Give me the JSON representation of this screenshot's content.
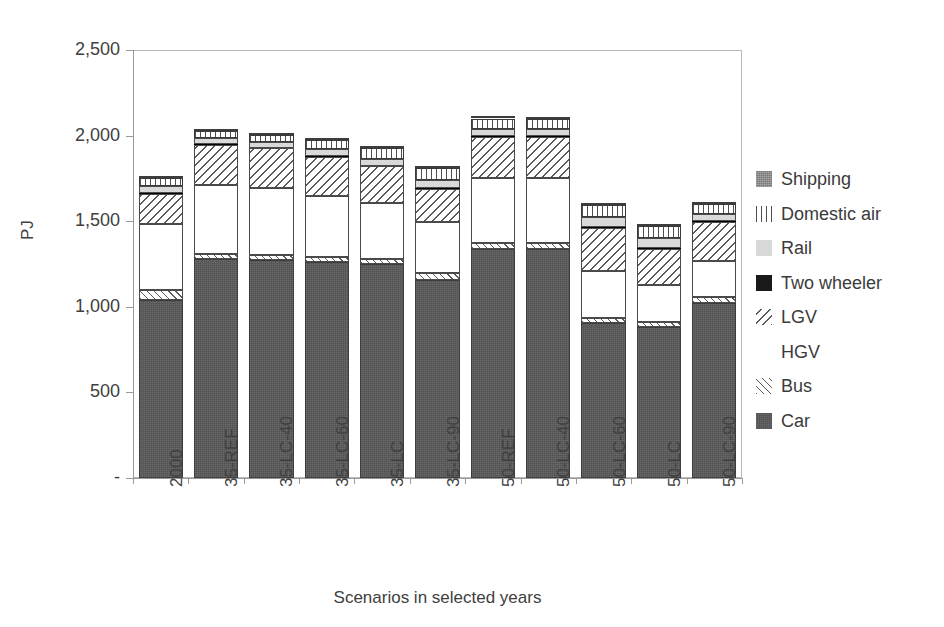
{
  "chart_data": {
    "type": "bar",
    "subtype": "stacked-vertical",
    "title": "",
    "xlabel": "Scenarios in selected years",
    "ylabel": "PJ",
    "ylim": [
      0,
      2500
    ],
    "ytick_values": [
      0,
      500,
      1000,
      1500,
      2000,
      2500
    ],
    "ytick_labels": [
      "-",
      "500",
      "1,000",
      "1,500",
      "2,000",
      "2,500"
    ],
    "grid": false,
    "legend_position": "right",
    "categories": [
      "2000",
      "35-REF",
      "35-LC-40",
      "35-LC-60",
      "35-LC",
      "35-LC-90",
      "50-REF",
      "50-LC-40",
      "50-LC-60",
      "50-LC",
      "50-LC-90"
    ],
    "series": [
      {
        "name": "Car",
        "pattern": "solid-dark-gray",
        "values": [
          1040,
          1280,
          1275,
          1260,
          1250,
          1155,
          1340,
          1340,
          905,
          880,
          1020
        ]
      },
      {
        "name": "Bus",
        "pattern": "diagonal-hatch-fwd",
        "values": [
          60,
          30,
          30,
          30,
          30,
          40,
          35,
          35,
          30,
          30,
          35
        ]
      },
      {
        "name": "HGV",
        "pattern": "white",
        "values": [
          385,
          400,
          390,
          360,
          325,
          300,
          375,
          375,
          275,
          215,
          210
        ]
      },
      {
        "name": "LGV",
        "pattern": "diagonal-hatch-back",
        "values": [
          175,
          235,
          230,
          225,
          215,
          195,
          240,
          240,
          250,
          215,
          230
        ]
      },
      {
        "name": "Two wheeler",
        "pattern": "solid-black",
        "values": [
          5,
          5,
          5,
          5,
          5,
          5,
          5,
          5,
          5,
          5,
          5
        ]
      },
      {
        "name": "Rail",
        "pattern": "light-gray",
        "values": [
          40,
          35,
          35,
          40,
          40,
          45,
          45,
          45,
          60,
          55,
          45
        ]
      },
      {
        "name": "Domestic air",
        "pattern": "vertical-stripes",
        "values": [
          45,
          40,
          40,
          55,
          60,
          70,
          60,
          55,
          70,
          70,
          55
        ]
      },
      {
        "name": "Shipping",
        "pattern": "texture-gray",
        "values": [
          10,
          10,
          10,
          10,
          10,
          10,
          10,
          10,
          10,
          10,
          10
        ]
      }
    ],
    "totals": [
      1760,
      2035,
      2015,
      1985,
      1935,
      1810,
      2110,
      2100,
      1605,
      1480,
      1610
    ]
  },
  "legend": {
    "items": [
      {
        "label": "Shipping",
        "pattern_class": "p-shipping"
      },
      {
        "label": "Domestic air",
        "pattern_class": "p-domesticair"
      },
      {
        "label": "Rail",
        "pattern_class": "p-rail"
      },
      {
        "label": "Two wheeler",
        "pattern_class": "p-twowheeler"
      },
      {
        "label": "LGV",
        "pattern_class": "p-lgv"
      },
      {
        "label": "HGV",
        "pattern_class": "p-hgv"
      },
      {
        "label": "Bus",
        "pattern_class": "p-bus"
      },
      {
        "label": "Car",
        "pattern_class": "p-car"
      }
    ]
  },
  "colors": {
    "car": "#595959",
    "shipping": "#8d8d8d",
    "rail": "#d9d9d9",
    "two_wheeler": "#1a1a1a",
    "outline": "#4a4a4a",
    "axis": "#9a9a9a",
    "text": "#404040",
    "background": "#ffffff"
  }
}
